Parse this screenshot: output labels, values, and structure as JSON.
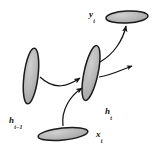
{
  "diagram": {
    "type": "node-link-diagram",
    "background_color": "#ffffff",
    "node_fill_color": "#b3b3b3",
    "node_stroke_color": "#1a1a1a",
    "edge_color": "#1a1a1a",
    "label_color": "#111111",
    "nodes": [
      {
        "id": "y_t",
        "name": "output-node",
        "label_base": "y",
        "label_sub": "t",
        "shape": "ellipse",
        "orientation": "horizontal",
        "cx": 127,
        "cy": 17,
        "rx": 21,
        "ry": 6,
        "rotation": -3
      },
      {
        "id": "h_t",
        "name": "hidden-state-current-node",
        "label_base": "h",
        "label_sub": "t",
        "shape": "ellipse",
        "orientation": "vertical",
        "cx": 91,
        "cy": 73,
        "rx": 7,
        "ry": 28,
        "rotation": 12
      },
      {
        "id": "h_t-1",
        "name": "hidden-state-previous-node",
        "label_base": "h",
        "label_sub": "t−1",
        "shape": "ellipse",
        "orientation": "vertical",
        "cx": 31,
        "cy": 76,
        "rx": 7,
        "ry": 28,
        "rotation": 7
      },
      {
        "id": "x_t",
        "name": "input-node",
        "label_base": "x",
        "label_sub": "t",
        "shape": "ellipse",
        "orientation": "horizontal",
        "cx": 63,
        "cy": 134,
        "rx": 25,
        "ry": 6,
        "rotation": -6
      }
    ],
    "edges": [
      {
        "id": "edge-h-prev-to-h-cur",
        "name": "recurrent-edge",
        "from": "h_t-1",
        "to": "h_t",
        "arrowhead": true,
        "style": "curved"
      },
      {
        "id": "edge-x-to-h-cur",
        "name": "input-edge",
        "from": "x_t",
        "to": "h_t",
        "arrowhead": true,
        "style": "curved"
      },
      {
        "id": "edge-h-cur-to-y",
        "name": "output-edge",
        "from": "h_t",
        "to": "y_t",
        "arrowhead": true,
        "style": "curved"
      },
      {
        "id": "edge-h-cur-to-next",
        "name": "next-step-edge",
        "from": "h_t",
        "to": "offscreen-right",
        "arrowhead": true,
        "style": "curved"
      }
    ]
  }
}
